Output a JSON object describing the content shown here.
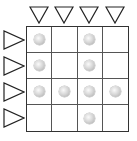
{
  "game": {
    "type": "grid-puzzle",
    "rows": 4,
    "cols": 4,
    "column_markers": [
      "down-triangle",
      "down-triangle",
      "down-triangle",
      "down-triangle"
    ],
    "row_markers": [
      "right-triangle",
      "right-triangle",
      "right-triangle",
      "right-triangle"
    ],
    "balls": [
      [
        1,
        0,
        1,
        0
      ],
      [
        1,
        0,
        1,
        0
      ],
      [
        1,
        1,
        1,
        1
      ],
      [
        0,
        0,
        1,
        0
      ]
    ],
    "colors": {
      "grid_line": "#333333",
      "ball": "#c8c8c8",
      "triangle_stroke": "#222222"
    }
  }
}
